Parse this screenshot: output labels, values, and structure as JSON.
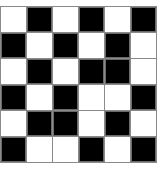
{
  "board": {
    "rows": 6,
    "cols": 6,
    "colors": {
      "black": "#000000",
      "white": "#ffffff",
      "grid_line": "#8a8a8a"
    },
    "cells": [
      [
        "W",
        "B",
        "W",
        "B",
        "W",
        "B"
      ],
      [
        "B",
        "W",
        "B",
        "W",
        "B",
        "W"
      ],
      [
        "W",
        "B",
        "W",
        "B",
        "B",
        "W"
      ],
      [
        "B",
        "W",
        "B",
        "W",
        "W",
        "B"
      ],
      [
        "W",
        "B",
        "B",
        "W",
        "B",
        "W"
      ],
      [
        "B",
        "W",
        "W",
        "B",
        "W",
        "B"
      ]
    ]
  }
}
